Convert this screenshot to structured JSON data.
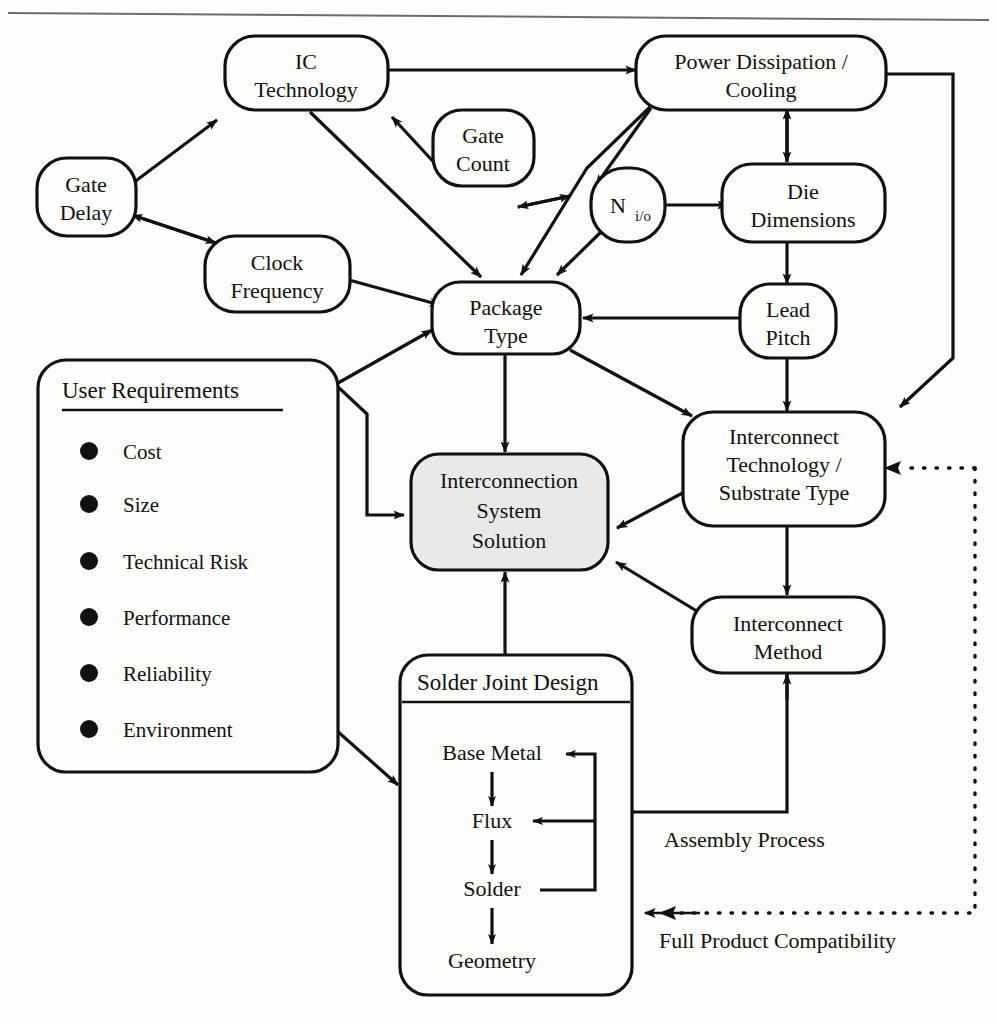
{
  "diagram": {
    "accent_color": "#111111",
    "background_color": "#fdfdfb",
    "highlight_fill": "#e9e9e9"
  },
  "nodes": {
    "ic_technology": {
      "line1": "IC",
      "line2": "Technology"
    },
    "power_dissipation": {
      "line1": "Power Dissipation /",
      "line2": "Cooling"
    },
    "gate_count": {
      "line1": "Gate",
      "line2": "Count"
    },
    "gate_delay": {
      "line1": "Gate",
      "line2": "Delay"
    },
    "n_io": {
      "main": "N",
      "subscript": "i/o"
    },
    "die_dimensions": {
      "line1": "Die",
      "line2": "Dimensions"
    },
    "clock_frequency": {
      "line1": "Clock",
      "line2": "Frequency"
    },
    "package_type": {
      "line1": "Package",
      "line2": "Type"
    },
    "lead_pitch": {
      "line1": "Lead",
      "line2": "Pitch"
    },
    "interconnect_technology": {
      "line1": "Interconnect",
      "line2": "Technology /",
      "line3": "Substrate Type"
    },
    "interconnection_system_solution": {
      "line1": "Interconnection",
      "line2": "System",
      "line3": "Solution"
    },
    "interconnect_method": {
      "line1": "Interconnect",
      "line2": "Method"
    }
  },
  "user_requirements": {
    "title": "User Requirements",
    "items": [
      "Cost",
      "Size",
      "Technical Risk",
      "Performance",
      "Reliability",
      "Environment"
    ]
  },
  "solder_joint_design": {
    "title": "Solder Joint Design",
    "steps": [
      "Base Metal",
      "Flux",
      "Solder",
      "Geometry"
    ]
  },
  "edge_labels": {
    "assembly_process": "Assembly Process",
    "full_product_compatibility": "Full Product Compatibility"
  }
}
